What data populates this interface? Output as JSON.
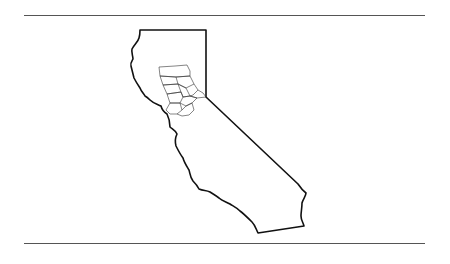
{
  "figure": {
    "colors": {
      "background": "#ffffff",
      "state_outline": "#111111",
      "county_lines": "#333333",
      "rules": "#555555"
    },
    "rules": [
      {
        "position": "top",
        "y": 15
      },
      {
        "position": "bottom",
        "y": 243
      }
    ],
    "regions": [
      {
        "name": "california-outline",
        "type": "state"
      },
      {
        "name": "northern-counties-cluster",
        "type": "county-group",
        "count_approx": 12
      }
    ]
  }
}
